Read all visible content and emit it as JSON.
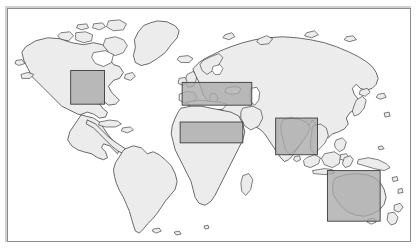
{
  "figure": {
    "projection": "equirectangular",
    "background_color": "#ffffff",
    "frame_color": "#8c8c8c",
    "land_fill_color": "#ececec",
    "coastline_color": "#2b2b2b",
    "highlight_fill_color": "#a9a9a9",
    "highlight_stroke_color": "#3a3a3a",
    "highlight_opacity": "0.78"
  },
  "regions": [
    {
      "id": "north-america",
      "name": "North America",
      "x": 63,
      "y": 62,
      "width": 34,
      "height": 34
    },
    {
      "id": "europe-mediterranean",
      "name": "Europe and Mediterranean",
      "x": 175,
      "y": 74,
      "width": 70,
      "height": 23
    },
    {
      "id": "north-africa",
      "name": "North Africa",
      "x": 173,
      "y": 114,
      "width": 63,
      "height": 21
    },
    {
      "id": "south-asia",
      "name": "South Asia",
      "x": 269,
      "y": 110,
      "width": 42,
      "height": 37
    },
    {
      "id": "australia",
      "name": "Australia",
      "x": 321,
      "y": 163,
      "width": 53,
      "height": 51
    }
  ],
  "continents": [
    {
      "id": "north-america",
      "name": "North America"
    },
    {
      "id": "south-america",
      "name": "South America"
    },
    {
      "id": "greenland",
      "name": "Greenland"
    },
    {
      "id": "africa",
      "name": "Africa"
    },
    {
      "id": "eurasia",
      "name": "Eurasia"
    },
    {
      "id": "australia",
      "name": "Australia"
    },
    {
      "id": "new-zealand",
      "name": "New Zealand"
    },
    {
      "id": "japan",
      "name": "Japan"
    },
    {
      "id": "madagascar",
      "name": "Madagascar"
    },
    {
      "id": "indonesia",
      "name": "Indonesia"
    },
    {
      "id": "philippines",
      "name": "Philippines"
    },
    {
      "id": "british-isles",
      "name": "British Isles"
    },
    {
      "id": "iceland",
      "name": "Iceland"
    },
    {
      "id": "new-guinea",
      "name": "New Guinea"
    },
    {
      "id": "sri-lanka",
      "name": "Sri Lanka"
    },
    {
      "id": "cuba",
      "name": "Cuba"
    },
    {
      "id": "borneo",
      "name": "Borneo"
    },
    {
      "id": "sumatra",
      "name": "Sumatra"
    },
    {
      "id": "tasmania",
      "name": "Tasmania"
    }
  ]
}
